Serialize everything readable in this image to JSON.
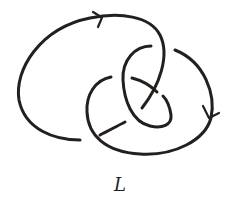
{
  "diagram": {
    "type": "knot-diagram",
    "label": "L",
    "stroke_color": "#231f1c",
    "background": "#ffffff",
    "components": 1,
    "crossings_visible": 4,
    "orientation_arrows": [
      {
        "position": "top",
        "direction": "right"
      },
      {
        "position": "right",
        "direction": "down"
      }
    ]
  }
}
